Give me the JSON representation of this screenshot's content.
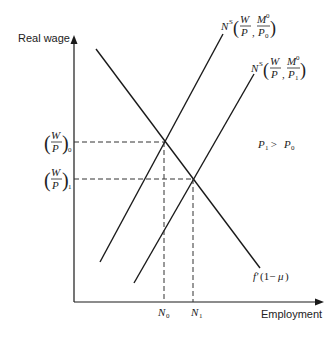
{
  "diagram": {
    "axes": {
      "y_label": "Real wage",
      "x_label": "Employment"
    },
    "curves": {
      "labor_demand": {
        "label_main": "f'",
        "label_paren": "(1−",
        "label_mu": "μ",
        "label_close": ")"
      },
      "supply_p0": {
        "label_N": "N",
        "label_S": "S",
        "frac1_num": "W",
        "frac1_den": "P",
        "frac2_num": "M",
        "frac2_num_sup": "0",
        "frac2_den": "P",
        "frac2_den_sub": "0"
      },
      "supply_p1": {
        "label_N": "N",
        "label_S": "S",
        "frac1_num": "W",
        "frac1_den": "P",
        "frac2_num": "M",
        "frac2_num_sup": "0",
        "frac2_den": "P",
        "frac2_den_sub": "1"
      }
    },
    "y_ticks": [
      {
        "num": "W",
        "den": "P",
        "sub": "0"
      },
      {
        "num": "W",
        "den": "P",
        "sub": "1"
      }
    ],
    "x_ticks": [
      {
        "main": "N",
        "sub": "0"
      },
      {
        "main": "N",
        "sub": "1"
      }
    ],
    "annotation": {
      "p1": "P",
      "p1_sub": "1",
      "gt": " > ",
      "p0": "P",
      "p0_sub": "0"
    },
    "colors": {
      "line": "#1a1a1a",
      "dash": "#333333",
      "background": "#ffffff"
    }
  }
}
